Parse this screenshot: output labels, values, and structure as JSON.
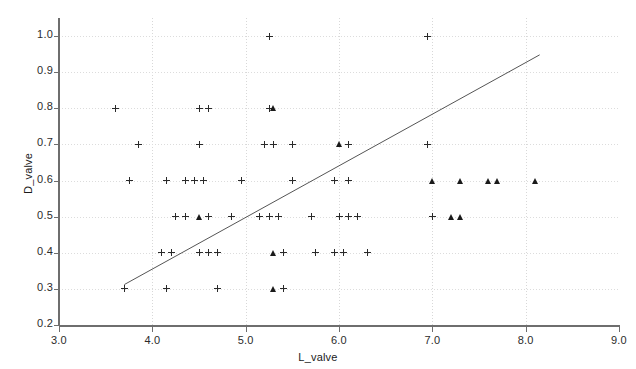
{
  "chart_data": {
    "type": "scatter",
    "title": "",
    "xlabel": "L_valve",
    "ylabel": "D_valve",
    "xlim": [
      3.0,
      9.0
    ],
    "ylim": [
      0.2,
      1.05
    ],
    "xticks": [
      "3.0",
      "4.0",
      "5.0",
      "6.0",
      "7.0",
      "8.0",
      "9.0"
    ],
    "xtick_values": [
      3.0,
      4.0,
      5.0,
      6.0,
      7.0,
      8.0,
      9.0
    ],
    "yticks": [
      "0.2",
      "0.3",
      "0.4",
      "0.5",
      "0.6",
      "0.7",
      "0.8",
      "0.9",
      "1.0"
    ],
    "ytick_values": [
      0.2,
      0.3,
      0.4,
      0.5,
      0.6,
      0.7,
      0.8,
      0.9,
      1.0
    ],
    "grid": true,
    "legend": "none",
    "series": [
      {
        "name": "plus-markers",
        "marker": "plus",
        "color": "#2a2a2a",
        "points": [
          [
            5.25,
            1.0
          ],
          [
            6.95,
            1.0
          ],
          [
            3.6,
            0.8
          ],
          [
            4.5,
            0.8
          ],
          [
            4.6,
            0.8
          ],
          [
            5.25,
            0.8
          ],
          [
            3.85,
            0.7
          ],
          [
            4.5,
            0.7
          ],
          [
            5.2,
            0.7
          ],
          [
            5.3,
            0.7
          ],
          [
            5.5,
            0.7
          ],
          [
            6.1,
            0.7
          ],
          [
            6.95,
            0.7
          ],
          [
            3.75,
            0.6
          ],
          [
            4.15,
            0.6
          ],
          [
            4.35,
            0.6
          ],
          [
            4.45,
            0.6
          ],
          [
            4.55,
            0.6
          ],
          [
            4.95,
            0.6
          ],
          [
            5.5,
            0.6
          ],
          [
            5.95,
            0.6
          ],
          [
            6.1,
            0.6
          ],
          [
            4.25,
            0.5
          ],
          [
            4.35,
            0.5
          ],
          [
            4.6,
            0.5
          ],
          [
            4.85,
            0.5
          ],
          [
            5.15,
            0.5
          ],
          [
            5.25,
            0.5
          ],
          [
            5.35,
            0.5
          ],
          [
            5.7,
            0.5
          ],
          [
            6.0,
            0.5
          ],
          [
            6.1,
            0.5
          ],
          [
            6.2,
            0.5
          ],
          [
            7.0,
            0.5
          ],
          [
            4.1,
            0.4
          ],
          [
            4.2,
            0.4
          ],
          [
            4.5,
            0.4
          ],
          [
            4.6,
            0.4
          ],
          [
            4.7,
            0.4
          ],
          [
            5.4,
            0.4
          ],
          [
            5.75,
            0.4
          ],
          [
            5.95,
            0.4
          ],
          [
            6.05,
            0.4
          ],
          [
            6.3,
            0.4
          ],
          [
            3.7,
            0.3
          ],
          [
            4.15,
            0.3
          ],
          [
            4.7,
            0.3
          ],
          [
            5.4,
            0.3
          ]
        ]
      },
      {
        "name": "triangle-markers",
        "marker": "triangle",
        "color": "#1a1a1a",
        "points": [
          [
            5.3,
            0.8
          ],
          [
            6.0,
            0.7
          ],
          [
            7.0,
            0.6
          ],
          [
            7.3,
            0.6
          ],
          [
            7.6,
            0.6
          ],
          [
            7.7,
            0.6
          ],
          [
            8.1,
            0.6
          ],
          [
            4.5,
            0.5
          ],
          [
            7.2,
            0.5
          ],
          [
            7.3,
            0.5
          ],
          [
            5.3,
            0.4
          ],
          [
            5.3,
            0.3
          ]
        ]
      }
    ],
    "fit_line": {
      "name": "regression-line",
      "color": "#555555",
      "x_start": 3.7,
      "y_start": 0.312,
      "x_end": 8.15,
      "y_end": 0.948
    }
  }
}
